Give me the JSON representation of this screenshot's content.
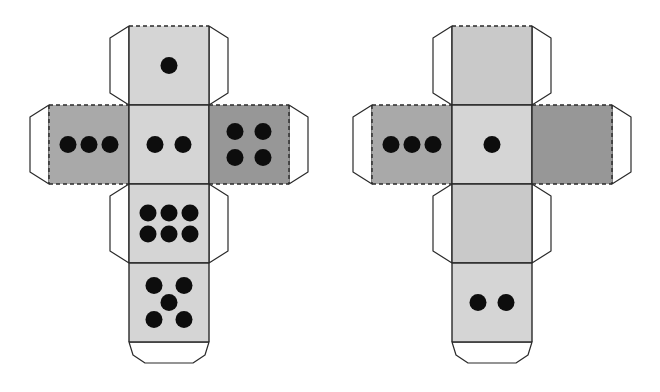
{
  "figure": {
    "canvas": {
      "width": 660,
      "height": 392,
      "background": "#ffffff"
    }
  },
  "style": {
    "line_color": "#2a2a2a",
    "line_width": 1.4,
    "tab_line_width": 1.2,
    "dash_pattern": "4 3",
    "pip_color": "#0d0d0d",
    "pip_radius": 8.5,
    "tab_fill": "#ffffff",
    "tab_width": 19,
    "tab_corner_cut": 12,
    "bottom_tab_height": 21,
    "bottom_tab_chamfer_x": 16,
    "bottom_tab_mid_drop": 13,
    "palette": {
      "light": "#d5d5d5",
      "light2": "#c9c9c9",
      "mid": "#a9a9a9",
      "dark": "#979797"
    }
  },
  "pip_layouts": {
    "0": [],
    "1": [
      [
        0,
        0
      ]
    ],
    "2": [
      [
        -14,
        0
      ],
      [
        14,
        0
      ]
    ],
    "3": [
      [
        -21,
        0
      ],
      [
        0,
        0
      ],
      [
        21,
        0
      ]
    ],
    "4": [
      [
        -14,
        -13
      ],
      [
        14,
        -13
      ],
      [
        -14,
        13
      ],
      [
        14,
        13
      ]
    ],
    "5": [
      [
        -15,
        -17
      ],
      [
        15,
        -17
      ],
      [
        0,
        0
      ],
      [
        -15,
        17
      ],
      [
        15,
        17
      ]
    ],
    "6": [
      [
        -21,
        -10.5
      ],
      [
        0,
        -10.5
      ],
      [
        21,
        -10.5
      ],
      [
        -21,
        10.5
      ],
      [
        0,
        10.5
      ],
      [
        21,
        10.5
      ]
    ]
  },
  "nets": [
    {
      "name": "die-net-left",
      "origin_x": 129,
      "origin_y": 26,
      "face_w": 80,
      "face_h": 79,
      "faces": [
        {
          "id": "top-face-1",
          "pips": 1,
          "col": 1,
          "row": 0,
          "shade": "light",
          "dashed_edges": [
            "top"
          ],
          "tabs": [
            "left",
            "right"
          ]
        },
        {
          "id": "left-face-3",
          "pips": 3,
          "col": 0,
          "row": 1,
          "shade": "mid",
          "dashed_edges": [
            "top",
            "bottom",
            "left"
          ],
          "tabs": [
            "left"
          ]
        },
        {
          "id": "center-face-2",
          "pips": 2,
          "col": 1,
          "row": 1,
          "shade": "light",
          "dashed_edges": [],
          "tabs": []
        },
        {
          "id": "right-face-4",
          "pips": 4,
          "col": 2,
          "row": 1,
          "shade": "dark",
          "dashed_edges": [
            "top",
            "bottom",
            "right"
          ],
          "tabs": [
            "right"
          ]
        },
        {
          "id": "lower-face-6",
          "pips": 6,
          "col": 1,
          "row": 2,
          "shade": "light",
          "dashed_edges": [],
          "tabs": [
            "left",
            "right"
          ]
        },
        {
          "id": "bottom-face-5",
          "pips": 5,
          "col": 1,
          "row": 3,
          "shade": "light",
          "dashed_edges": [],
          "tabs": [
            "bottom"
          ]
        }
      ]
    },
    {
      "name": "die-net-right",
      "origin_x": 452,
      "origin_y": 26,
      "face_w": 80,
      "face_h": 79,
      "faces": [
        {
          "id": "top-face-blank",
          "pips": 0,
          "col": 1,
          "row": 0,
          "shade": "light2",
          "dashed_edges": [
            "top"
          ],
          "tabs": [
            "left",
            "right"
          ]
        },
        {
          "id": "left-face-3",
          "pips": 3,
          "col": 0,
          "row": 1,
          "shade": "mid",
          "dashed_edges": [
            "top",
            "bottom",
            "left"
          ],
          "tabs": [
            "left"
          ]
        },
        {
          "id": "center-face-1",
          "pips": 1,
          "col": 1,
          "row": 1,
          "shade": "light",
          "dashed_edges": [],
          "tabs": []
        },
        {
          "id": "right-face-blank",
          "pips": 0,
          "col": 2,
          "row": 1,
          "shade": "dark",
          "dashed_edges": [
            "top",
            "bottom",
            "right"
          ],
          "tabs": [
            "right"
          ]
        },
        {
          "id": "lower-face-blank",
          "pips": 0,
          "col": 1,
          "row": 2,
          "shade": "light2",
          "dashed_edges": [],
          "tabs": [
            "left",
            "right"
          ]
        },
        {
          "id": "bottom-face-2",
          "pips": 2,
          "col": 1,
          "row": 3,
          "shade": "light",
          "dashed_edges": [],
          "tabs": [
            "bottom"
          ]
        }
      ]
    }
  ]
}
